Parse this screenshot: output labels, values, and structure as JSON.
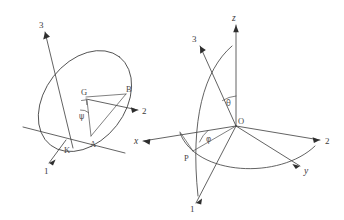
{
  "figure": {
    "background_color": "#ffffff",
    "line_color": "#3b3b3b",
    "label_color": "#3a3a3a",
    "width": 344,
    "height": 220
  },
  "left_diagram": {
    "name": "euler-angle-ellipse-diagram",
    "axes": [
      {
        "id": "axis-3",
        "label": "3"
      },
      {
        "id": "axis-2",
        "label": "2"
      },
      {
        "id": "axis-1",
        "label": "1"
      }
    ],
    "points": [
      {
        "id": "point-G",
        "label": "G"
      },
      {
        "id": "point-B",
        "label": "B"
      },
      {
        "id": "point-A",
        "label": "A"
      },
      {
        "id": "point-K",
        "label": "K"
      }
    ],
    "angles": [
      {
        "id": "angle-psi",
        "label": "ψ"
      }
    ]
  },
  "right_diagram": {
    "name": "spherical-coordinate-diagram",
    "axes": [
      {
        "id": "axis-z",
        "label": "z"
      },
      {
        "id": "axis-x",
        "label": "x"
      },
      {
        "id": "axis-y",
        "label": "y"
      },
      {
        "id": "axis-2",
        "label": "2"
      },
      {
        "id": "axis-3",
        "label": "3"
      },
      {
        "id": "axis-1",
        "label": "1"
      }
    ],
    "points": [
      {
        "id": "point-O",
        "label": "O"
      },
      {
        "id": "point-P",
        "label": "P"
      }
    ],
    "angles": [
      {
        "id": "angle-theta",
        "label": "θ"
      },
      {
        "id": "angle-phi",
        "label": "φ"
      }
    ]
  }
}
